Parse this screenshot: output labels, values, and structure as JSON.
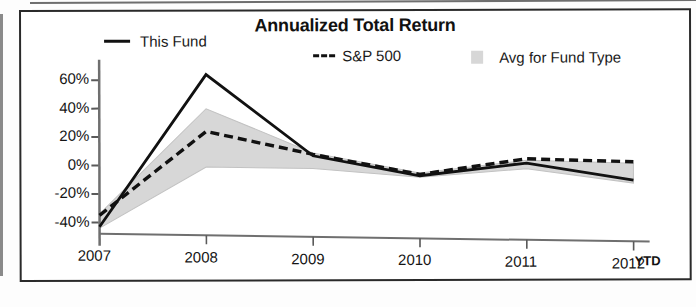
{
  "figure": {
    "title": "Annualized Total Return",
    "ytd_note": "YTD"
  },
  "legend": {
    "items": [
      {
        "label": "This Fund",
        "marker": "solid-line",
        "color": "#111111"
      },
      {
        "label": "S&P 500",
        "marker": "dashed-line",
        "color": "#111111"
      },
      {
        "label": "Avg for Fund Type",
        "marker": "filled-band",
        "color": "#d7d7d7"
      }
    ]
  },
  "chart_data": {
    "type": "line",
    "title": "Annualized Total Return",
    "xlabel": "",
    "ylabel": "",
    "categories": [
      "2007",
      "2008",
      "2009",
      "2010",
      "2011",
      "2012"
    ],
    "x_tick_labels": [
      "2007",
      "2008",
      "2009",
      "2010",
      "2011",
      "2012"
    ],
    "x_tick_suffix": "YTD",
    "y_tick_labels": [
      "60%",
      "40%",
      "20%",
      "0%",
      "-20%",
      "-40%"
    ],
    "y_tick_values": [
      60,
      40,
      20,
      0,
      -20,
      -40
    ],
    "ylim": [
      -48,
      68
    ],
    "grid": false,
    "legend_position": "top",
    "series": [
      {
        "name": "This Fund",
        "style": "solid",
        "color": "#111111",
        "values": [
          -43,
          65,
          9,
          -4,
          6,
          -5
        ]
      },
      {
        "name": "S&P 500",
        "style": "dashed",
        "color": "#111111",
        "values": [
          -35,
          25,
          10,
          -3,
          9,
          8
        ]
      },
      {
        "name": "Avg for Fund Type",
        "style": "band",
        "color": "#d7d7d7",
        "upper_values": [
          -34,
          41,
          11,
          -2,
          8,
          7
        ],
        "lower_values": [
          -44,
          0,
          0,
          -5,
          2,
          -7
        ]
      }
    ]
  }
}
